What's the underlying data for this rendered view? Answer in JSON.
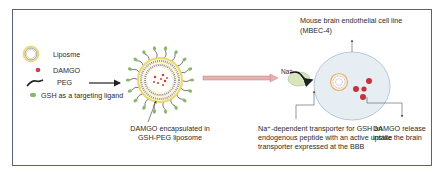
{
  "legend": {
    "items": [
      {
        "icon": "liposome-icon",
        "label": "Liposme"
      },
      {
        "icon": "damgo-dot-icon",
        "label": "DAMGO"
      },
      {
        "icon": "peg-chain-icon",
        "label": "PEG"
      },
      {
        "icon": "gsh-ligand-icon",
        "label": "GSH as a targeting ligand"
      }
    ]
  },
  "liposome": {
    "caption_line1": "DAMGO encapsulated in",
    "caption_line2": "GSH-PEG liposome"
  },
  "cell": {
    "title_line1": "Mouse brain endothelial cell line",
    "title_line2": "(MBEC-4)",
    "sodium_label": "Na⁺",
    "transporter_line1": "Na⁺-dependent transporter for GSH an",
    "transporter_line2": "endogenous peptide with an active uptake",
    "transporter_line3": "transporter expressed at the BBB",
    "release_line1": "DAMGO release",
    "release_line2": "inside the brain"
  },
  "colors": {
    "frame": "#5a5f7a",
    "liposome_ring": "#e8d870",
    "damgo": "#d0404a",
    "gsh": "#8ab86a",
    "peg": "#222222",
    "pink_arrow": "#e0a0a0",
    "cell_fill": "#e6eef4",
    "transporter": "#d8e6c0"
  }
}
